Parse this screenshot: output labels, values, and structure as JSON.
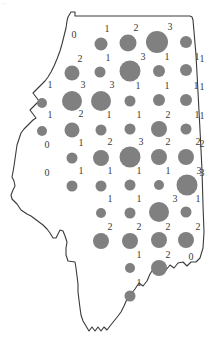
{
  "figure": {
    "corner_mark": "''",
    "title": "",
    "boundary_color": "#3a3a3a",
    "bubble_color": "#808080",
    "label_color": "#3a3a3a",
    "background": "#ffffff"
  },
  "chart_data": {
    "type": "bubble-map",
    "title": "",
    "subtitle": "",
    "xlabel": "",
    "ylabel": "",
    "legend": [],
    "grid": false,
    "value_field": "label",
    "size_field": "radius_px",
    "units": "",
    "note": "Proportional-symbol map: gray circles sized by magnitude, each annotated with an integer class label placed above-left of the symbol.",
    "boundary_name": "state-outline",
    "boundary_path": "M 68,17 L 71,12 L 75,12 L 75,16 L 190,16 L 192,17 L 193,20 L 196,55 L 198,92 L 200,130 L 202,170 L 203,205 L 204,232 L 203,248 L 200,258 L 196,262 L 191,262 L 187,266 L 183,262 L 178,263 L 174,268 L 170,265 L 166,270 L 162,266 L 158,270 L 154,268 L 150,274 L 147,281 L 143,286 L 139,283 L 135,289 L 131,294 L 127,299 L 124,306 L 121,312 L 118,316 L 114,321 L 110,326 L 107,330 L 104,327 L 101,331 L 98,327 L 95,331 L 92,327 L 89,331 L 86,326 L 83,321 L 81,315 L 80,308 L 79,300 L 78,292 L 78,284 L 77,276 L 76,268 L 75,262 L 68,261 L 66,255 L 66,248 L 67,242 L 65,236 L 63,231 L 60,230 L 58,234 L 56,238 L 53,238 L 50,233 L 47,229 L 43,225 L 39,222 L 35,219 L 31,216 L 27,214 L 24,212 L 21,210 L 19,207 L 17,204 L 14,201 L 12,199 L 11,195 L 13,190 L 15,186 L 14,181 L 12,177 L 13,172 L 14,166 L 15,159 L 16,152 L 17,145 L 19,139 L 21,133 L 24,129 L 27,126 L 30,123 L 33,120 L 36,118 L 33,114 L 30,110 L 33,107 L 36,104 L 39,101 L 36,97 L 33,93 L 36,90 L 39,87 L 42,84 L 45,81 L 48,77 L 51,72 L 54,66 L 57,59 L 60,51 L 62,44 L 64,36 L 66,28 L 67,21 Z",
    "points": [
      {
        "id": "r1c1",
        "cx": 66,
        "cy": 45,
        "r": 0,
        "label": "0",
        "label_x": 74,
        "label_y": 38
      },
      {
        "id": "r1c2",
        "cx": 101,
        "cy": 44,
        "r": 6.5,
        "label": "1",
        "label_x": 107,
        "label_y": 32
      },
      {
        "id": "r1c3",
        "cx": 128,
        "cy": 43,
        "r": 8.5,
        "label": "2",
        "label_x": 136,
        "label_y": 31
      },
      {
        "id": "r1c4",
        "cx": 157,
        "cy": 42,
        "r": 11,
        "label": "3",
        "label_x": 170,
        "label_y": 30
      },
      {
        "id": "r1c5",
        "cx": 186,
        "cy": 42,
        "r": 6,
        "label": "",
        "label_x": 0,
        "label_y": 0
      },
      {
        "id": "r2c1",
        "cx": 72,
        "cy": 73,
        "r": 7.5,
        "label": "2",
        "label_x": 80,
        "label_y": 62
      },
      {
        "id": "r2c2",
        "cx": 100,
        "cy": 72,
        "r": 5.5,
        "label": "1",
        "label_x": 108,
        "label_y": 61
      },
      {
        "id": "r2c3",
        "cx": 130,
        "cy": 71,
        "r": 10.5,
        "label": "3",
        "label_x": 143,
        "label_y": 60
      },
      {
        "id": "r2c4",
        "cx": 159,
        "cy": 71,
        "r": 6,
        "label": "1",
        "label_x": 167,
        "label_y": 60
      },
      {
        "id": "r2c5",
        "cx": 186,
        "cy": 70,
        "r": 6,
        "label": "1",
        "label_x": 197,
        "label_y": 60
      },
      {
        "id": "r3c0",
        "cx": 42,
        "cy": 103,
        "r": 5,
        "label": "1",
        "label_x": 50,
        "label_y": 88
      },
      {
        "id": "r3c1",
        "cx": 72,
        "cy": 101,
        "r": 10,
        "label": "3",
        "label_x": 83,
        "label_y": 88
      },
      {
        "id": "r3c2",
        "cx": 101,
        "cy": 101,
        "r": 10,
        "label": "3",
        "label_x": 112,
        "label_y": 88
      },
      {
        "id": "r3c3",
        "cx": 130,
        "cy": 101,
        "r": 5.5,
        "label": "1",
        "label_x": 138,
        "label_y": 89
      },
      {
        "id": "r3c4",
        "cx": 159,
        "cy": 100,
        "r": 6,
        "label": "1",
        "label_x": 167,
        "label_y": 89
      },
      {
        "id": "r3c5",
        "cx": 186,
        "cy": 100,
        "r": 6,
        "label": "1",
        "label_x": 196,
        "label_y": 89
      },
      {
        "id": "r4c0",
        "cx": 42,
        "cy": 131,
        "r": 5,
        "label": "1",
        "label_x": 50,
        "label_y": 118
      },
      {
        "id": "r4c1",
        "cx": 72,
        "cy": 130,
        "r": 7.5,
        "label": "2",
        "label_x": 81,
        "label_y": 117
      },
      {
        "id": "r4c2",
        "cx": 101,
        "cy": 130,
        "r": 5.5,
        "label": "1",
        "label_x": 109,
        "label_y": 118
      },
      {
        "id": "r4c3",
        "cx": 130,
        "cy": 129,
        "r": 5.5,
        "label": "1",
        "label_x": 139,
        "label_y": 118
      },
      {
        "id": "r4c4",
        "cx": 159,
        "cy": 129,
        "r": 8,
        "label": "2",
        "label_x": 168,
        "label_y": 118
      },
      {
        "id": "r4c5",
        "cx": 186,
        "cy": 129,
        "r": 5.5,
        "label": "1",
        "label_x": 197,
        "label_y": 118
      },
      {
        "id": "r5c0",
        "cx": 42,
        "cy": 158,
        "r": 0,
        "label": "0",
        "label_x": 47,
        "label_y": 148
      },
      {
        "id": "r5c1",
        "cx": 72,
        "cy": 158,
        "r": 5.5,
        "label": "1",
        "label_x": 81,
        "label_y": 146
      },
      {
        "id": "r5c2",
        "cx": 101,
        "cy": 158,
        "r": 8,
        "label": "2",
        "label_x": 110,
        "label_y": 145
      },
      {
        "id": "r5c3",
        "cx": 130,
        "cy": 157,
        "r": 10.5,
        "label": "3",
        "label_x": 141,
        "label_y": 145
      },
      {
        "id": "r5c4",
        "cx": 159,
        "cy": 157,
        "r": 8,
        "label": "2",
        "label_x": 168,
        "label_y": 145
      },
      {
        "id": "r5c5",
        "cx": 186,
        "cy": 157,
        "r": 8,
        "label": "2",
        "label_x": 198,
        "label_y": 145
      },
      {
        "id": "r6c0",
        "cx": 42,
        "cy": 186,
        "r": 0,
        "label": "0",
        "label_x": 47,
        "label_y": 176
      },
      {
        "id": "r6c1",
        "cx": 72,
        "cy": 186,
        "r": 5.5,
        "label": "1",
        "label_x": 81,
        "label_y": 174
      },
      {
        "id": "r6c2",
        "cx": 101,
        "cy": 186,
        "r": 5.5,
        "label": "1",
        "label_x": 110,
        "label_y": 174
      },
      {
        "id": "r6c3",
        "cx": 130,
        "cy": 185,
        "r": 5.5,
        "label": "1",
        "label_x": 139,
        "label_y": 174
      },
      {
        "id": "r6c4",
        "cx": 159,
        "cy": 185,
        "r": 5,
        "label": "1",
        "label_x": 168,
        "label_y": 174
      },
      {
        "id": "r6c5",
        "cx": 187,
        "cy": 185,
        "r": 10.5,
        "label": "3",
        "label_x": 199,
        "label_y": 174
      },
      {
        "id": "r7c2",
        "cx": 101,
        "cy": 213,
        "r": 5,
        "label": "1",
        "label_x": 110,
        "label_y": 202
      },
      {
        "id": "r7c3",
        "cx": 130,
        "cy": 213,
        "r": 5.5,
        "label": "1",
        "label_x": 139,
        "label_y": 202
      },
      {
        "id": "r7c4",
        "cx": 159,
        "cy": 212,
        "r": 10,
        "label": "3",
        "label_x": 175,
        "label_y": 202
      },
      {
        "id": "r7c5",
        "cx": 186,
        "cy": 212,
        "r": 5.5,
        "label": "1",
        "label_x": 198,
        "label_y": 202
      },
      {
        "id": "r8c2",
        "cx": 101,
        "cy": 241,
        "r": 8,
        "label": "2",
        "label_x": 110,
        "label_y": 230
      },
      {
        "id": "r8c3",
        "cx": 130,
        "cy": 241,
        "r": 8,
        "label": "2",
        "label_x": 139,
        "label_y": 230
      },
      {
        "id": "r8c4",
        "cx": 159,
        "cy": 240,
        "r": 8,
        "label": "2",
        "label_x": 168,
        "label_y": 230
      },
      {
        "id": "r8c5",
        "cx": 186,
        "cy": 240,
        "r": 8,
        "label": "2",
        "label_x": 198,
        "label_y": 230
      },
      {
        "id": "r9c3",
        "cx": 130,
        "cy": 268,
        "r": 5,
        "label": "1",
        "label_x": 139,
        "label_y": 258
      },
      {
        "id": "r9c4",
        "cx": 159,
        "cy": 268,
        "r": 8,
        "label": "2",
        "label_x": 168,
        "label_y": 258
      },
      {
        "id": "r9c5",
        "cx": 186,
        "cy": 268,
        "r": 0,
        "label": "0",
        "label_x": 191,
        "label_y": 260
      },
      {
        "id": "r10c3",
        "cx": 130,
        "cy": 296,
        "r": 5.5,
        "label": "1",
        "label_x": 139,
        "label_y": 286
      }
    ],
    "edge_labels": [
      {
        "id": "e1",
        "text": "1",
        "x": 202,
        "y": 62
      },
      {
        "id": "e2",
        "text": "1",
        "x": 202,
        "y": 90
      },
      {
        "id": "e3",
        "text": "1",
        "x": 202,
        "y": 119
      },
      {
        "id": "e4",
        "text": "2",
        "x": 202,
        "y": 147
      },
      {
        "id": "e5",
        "text": "3",
        "x": 202,
        "y": 176
      }
    ]
  }
}
